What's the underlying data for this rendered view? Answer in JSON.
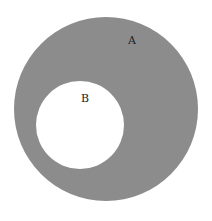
{
  "diagram": {
    "outer_circle": {
      "label": "A",
      "cx": 106,
      "cy": 109,
      "r": 92,
      "fill": "#8c8c8c"
    },
    "inner_circle": {
      "label": "B",
      "cx": 80,
      "cy": 125,
      "r": 44,
      "fill": "#ffffff"
    }
  }
}
